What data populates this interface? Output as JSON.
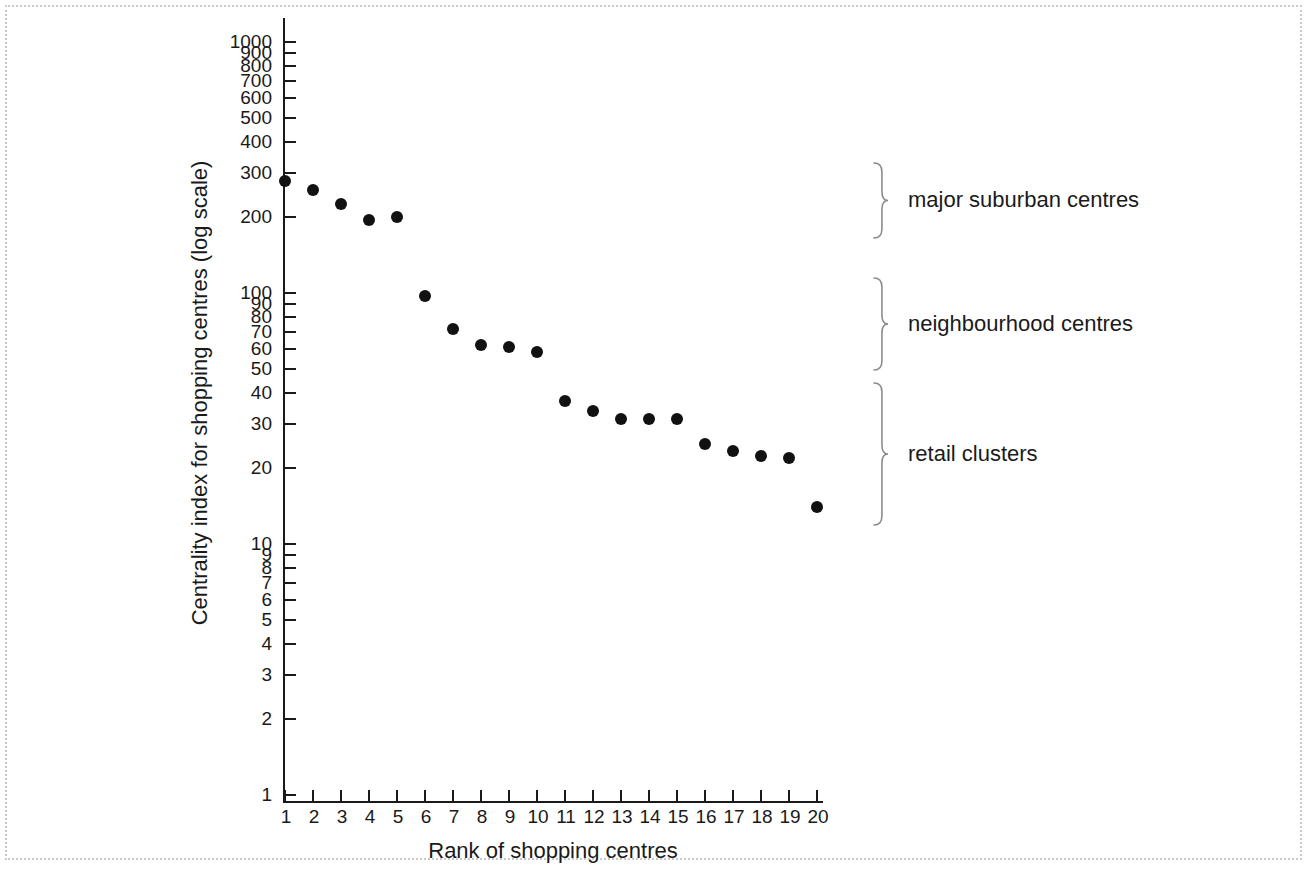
{
  "chart_data": {
    "type": "scatter",
    "title": "",
    "xlabel": "Rank of shopping centres",
    "ylabel": "Centrality index for shopping centres (log scale)",
    "yscale": "log",
    "ylim": [
      1,
      1000
    ],
    "xlim": [
      1,
      20
    ],
    "grid": false,
    "legend": null,
    "x": [
      1,
      2,
      3,
      4,
      5,
      6,
      7,
      8,
      9,
      10,
      11,
      12,
      13,
      14,
      15,
      16,
      17,
      18,
      19,
      20
    ],
    "values": [
      280,
      258,
      226,
      196,
      200,
      97,
      72,
      62,
      61,
      58,
      37,
      34,
      31.5,
      31.5,
      31.5,
      25,
      23.5,
      22.5,
      22,
      14
    ],
    "x_tick_labels": [
      "1",
      "2",
      "3",
      "4",
      "5",
      "6",
      "7",
      "8",
      "9",
      "10",
      "11",
      "12",
      "13",
      "14",
      "15",
      "16",
      "17",
      "18",
      "19",
      "20"
    ],
    "y_tick_labels": [
      "1000",
      "900",
      "800",
      "700",
      "600",
      "500",
      "400",
      "300",
      "200",
      "100",
      "90",
      "80",
      "70",
      "60",
      "50",
      "40",
      "30",
      "20",
      "10",
      "9",
      "8",
      "7",
      "6",
      "5",
      "4",
      "3",
      "2",
      "1"
    ],
    "y_tick_values": [
      1000,
      900,
      800,
      700,
      600,
      500,
      400,
      300,
      200,
      100,
      90,
      80,
      70,
      60,
      50,
      40,
      30,
      20,
      10,
      9,
      8,
      7,
      6,
      5,
      4,
      3,
      2,
      1
    ],
    "annotations": [
      {
        "label": "major suburban centres",
        "rank_range": [
          1,
          5
        ]
      },
      {
        "label": "neighbourhood centres",
        "rank_range": [
          6,
          10
        ]
      },
      {
        "label": "retail clusters",
        "rank_range": [
          11,
          20
        ]
      }
    ],
    "colors": {
      "point": "#111111",
      "axis": "#1a1a1a",
      "text": "#1a1a1a",
      "frame": "#c9c9c9",
      "background": "#ffffff"
    }
  }
}
